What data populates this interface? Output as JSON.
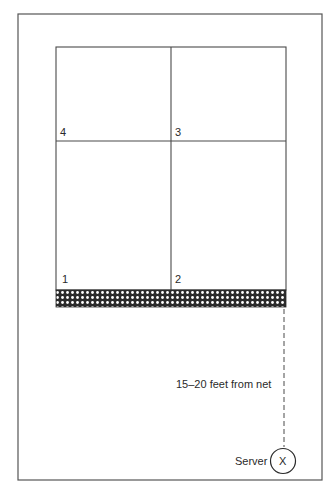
{
  "diagram": {
    "type": "volleyball-court-half-serving-zones",
    "zones": [
      {
        "id": "zone-4",
        "label": "4",
        "position": "top-left"
      },
      {
        "id": "zone-3",
        "label": "3",
        "position": "top-right"
      },
      {
        "id": "zone-1",
        "label": "1",
        "position": "bottom-left"
      },
      {
        "id": "zone-2",
        "label": "2",
        "position": "bottom-right"
      }
    ],
    "net": {
      "label": "",
      "pattern": "crosshatch"
    },
    "distance_label": "15–20 feet from net",
    "server": {
      "label": "Server",
      "marker": "X"
    }
  },
  "colors": {
    "line": "#4a4a4a",
    "net_dark": "#2b2b2b",
    "net_light": "#ffffff",
    "background": "#ffffff"
  }
}
